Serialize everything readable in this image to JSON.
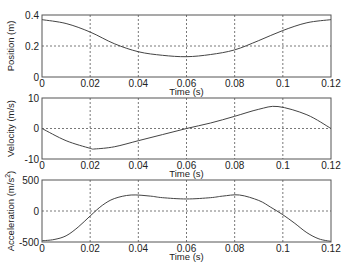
{
  "figure": {
    "width": 350,
    "height": 272,
    "line_color": "#444444",
    "grid_color": "#555555",
    "axis_color": "#555555"
  },
  "chart_data": [
    {
      "type": "line",
      "title": "",
      "xlabel": "Time (s)",
      "ylabel": "Position (m)",
      "xlim": [
        0,
        0.12
      ],
      "ylim": [
        0,
        0.4
      ],
      "xticks": [
        "0",
        "0.02",
        "0.04",
        "0.06",
        "0.08",
        "0.1",
        "0.12"
      ],
      "yticks": [
        "0",
        "0.2",
        "0.4"
      ],
      "grid": true,
      "x": [
        0,
        0.01,
        0.02,
        0.03,
        0.04,
        0.05,
        0.06,
        0.07,
        0.08,
        0.09,
        0.1,
        0.11,
        0.12
      ],
      "values": [
        0.37,
        0.345,
        0.29,
        0.215,
        0.163,
        0.14,
        0.131,
        0.145,
        0.175,
        0.235,
        0.3,
        0.35,
        0.37
      ]
    },
    {
      "type": "line",
      "title": "",
      "xlabel": "Time (s)",
      "ylabel": "Velocity (m/s)",
      "xlim": [
        0,
        0.12
      ],
      "ylim": [
        -10,
        10
      ],
      "xticks": [
        "0",
        "0.02",
        "0.04",
        "0.06",
        "0.08",
        "0.1",
        "0.12"
      ],
      "yticks": [
        "-10",
        "0",
        "10"
      ],
      "grid": true,
      "x": [
        0,
        0.01,
        0.02,
        0.022,
        0.03,
        0.04,
        0.05,
        0.06,
        0.07,
        0.08,
        0.09,
        0.098,
        0.11,
        0.12
      ],
      "values": [
        0,
        -4.0,
        -6.5,
        -6.7,
        -6.0,
        -4.0,
        -2.0,
        0,
        1.8,
        4.0,
        6.3,
        7.2,
        4.5,
        0
      ]
    },
    {
      "type": "line",
      "title": "",
      "xlabel": "Time (s)",
      "ylabel": "Acceleration (m/s²)",
      "xlim": [
        0,
        0.12
      ],
      "ylim": [
        -500,
        500
      ],
      "xticks": [
        "0",
        "0.02",
        "0.04",
        "0.06",
        "0.08",
        "0.1",
        "0.12"
      ],
      "yticks": [
        "-500",
        "0",
        "500"
      ],
      "grid": true,
      "x": [
        0,
        0.005,
        0.01,
        0.015,
        0.02,
        0.025,
        0.03,
        0.037,
        0.045,
        0.05,
        0.06,
        0.07,
        0.075,
        0.082,
        0.09,
        0.095,
        0.1,
        0.105,
        0.11,
        0.115,
        0.12
      ],
      "values": [
        -480,
        -460,
        -400,
        -260,
        -80,
        90,
        200,
        258,
        240,
        215,
        194,
        215,
        240,
        258,
        170,
        60,
        -60,
        -200,
        -350,
        -450,
        -490
      ]
    }
  ],
  "labels": {
    "xlabel": "Time (s)",
    "ylabel_position": "Position (m)",
    "ylabel_velocity": "Velocity (m/s)",
    "ylabel_accel_prefix": "Acceleration (m/s",
    "ylabel_accel_sup": "2",
    "ylabel_accel_suffix": ")"
  }
}
